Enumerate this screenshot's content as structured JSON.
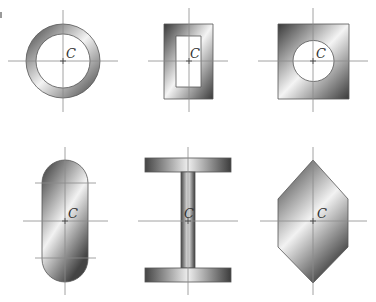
{
  "figure": {
    "centroid_label": "C",
    "shapes": [
      {
        "id": "hollow-circle",
        "name": "Hollow circular section",
        "center": [
          63,
          61
        ]
      },
      {
        "id": "hollow-rectangle",
        "name": "Hollow rectangular section",
        "center": [
          189,
          61
        ]
      },
      {
        "id": "square-with-hole",
        "name": "Square section with circular hole",
        "center": [
          313,
          61
        ]
      },
      {
        "id": "stadium",
        "name": "Rounded-end (stadium) section",
        "center": [
          65,
          221
        ]
      },
      {
        "id": "i-beam",
        "name": "I-beam section",
        "center": [
          188,
          221
        ]
      },
      {
        "id": "hexagon",
        "name": "Hexagonal section",
        "center": [
          313,
          221
        ]
      }
    ]
  },
  "colors": {
    "dark": "#3a3a3a",
    "mid": "#9a9a9a",
    "light": "#f4f4f4",
    "axis": "#8a8a8a"
  },
  "labels": {
    "c1": "C",
    "c2": "C",
    "c3": "C",
    "c4": "C",
    "c5": "C",
    "c6": "C"
  }
}
